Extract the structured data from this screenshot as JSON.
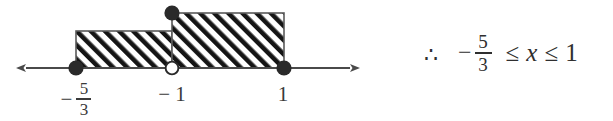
{
  "figure": {
    "type": "number-line-inequality-diagram",
    "axis": {
      "y": 68,
      "x_start": 14,
      "x_end": 362,
      "left_arrow": "arrow-left",
      "right_arrow": "arrow-right",
      "color": "#4a4a4a"
    },
    "points": [
      {
        "label": "-5/3",
        "x": 76,
        "y": 68,
        "marker": "closed-circle",
        "included": true
      },
      {
        "label": "-1",
        "x": 172,
        "y": 68,
        "marker": "open-circle",
        "included": false
      },
      {
        "label": "1",
        "x": 284,
        "y": 68,
        "marker": "closed-circle",
        "included": true
      },
      {
        "label": "-1-top",
        "x": 172,
        "y": 13,
        "marker": "closed-circle",
        "included": true
      }
    ],
    "regions": [
      {
        "name": "left-hatched-region",
        "x": 76,
        "y": 31,
        "width": 96,
        "height": 37,
        "fill": "diagonal-hatch"
      },
      {
        "name": "right-hatched-region",
        "x": 172,
        "y": 13,
        "width": 112,
        "height": 55,
        "fill": "diagonal-hatch"
      }
    ],
    "tick_labels": [
      {
        "name": "label-neg-five-thirds",
        "minus": "−",
        "numerator": "5",
        "denominator": "3"
      },
      {
        "name": "label-neg-one",
        "text": "− 1"
      },
      {
        "name": "label-one",
        "text": "1"
      }
    ]
  },
  "conclusion": {
    "therefore_symbol": "∴",
    "minus": "−",
    "numerator": "5",
    "denominator": "3",
    "relation_left": "≤",
    "variable": "x",
    "relation_right": "≤",
    "upper_bound": "1",
    "full_text": "∴  − 5/3 ≤ x ≤ 1"
  },
  "colors": {
    "ink": "#2b2b2b",
    "axis": "#4a4a4a",
    "hatch": "#1a1a1a",
    "outline": "#555555"
  }
}
